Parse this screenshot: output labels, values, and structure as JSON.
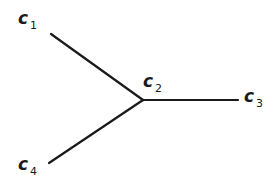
{
  "diagram": {
    "type": "branched-structure",
    "edge_color": "#1a1a1a",
    "background": "#ffffff",
    "nodes": [
      {
        "id": "c1",
        "letter": "c",
        "subscript": "1",
        "label_x": 18,
        "label_y": 10
      },
      {
        "id": "c2",
        "letter": "c",
        "subscript": "2",
        "label_x": 143,
        "label_y": 73
      },
      {
        "id": "c3",
        "letter": "c",
        "subscript": "3",
        "label_x": 244,
        "label_y": 88
      },
      {
        "id": "c4",
        "letter": "c",
        "subscript": "4",
        "label_x": 18,
        "label_y": 156
      }
    ],
    "edges": [
      {
        "from": "c1",
        "to": "c2",
        "x1": 51,
        "y1": 34,
        "x2": 143,
        "y2": 100
      },
      {
        "from": "c2",
        "to": "c3",
        "x1": 143,
        "y1": 100,
        "x2": 238,
        "y2": 100
      },
      {
        "from": "c4",
        "to": "c2",
        "x1": 49,
        "y1": 163,
        "x2": 143,
        "y2": 100
      }
    ]
  }
}
